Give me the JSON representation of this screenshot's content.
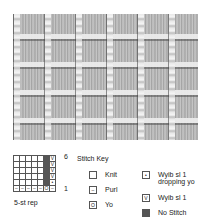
{
  "photo": {
    "alt": "Knitted swatch showing slip-stitch grid pattern"
  },
  "chart": {
    "rows": [
      [
        "",
        "",
        "",
        "",
        "",
        "dark",
        "V"
      ],
      [
        "",
        "",
        "",
        "",
        "",
        "dark",
        "V"
      ],
      [
        "",
        "",
        "",
        "",
        "",
        "dark",
        "V"
      ],
      [
        "",
        "",
        "",
        "",
        "",
        "dark",
        "V"
      ],
      [
        "",
        "",
        "",
        "",
        "",
        "dark",
        "•"
      ],
      [
        "–",
        "–",
        "–",
        "–",
        "–",
        "O",
        "–"
      ]
    ],
    "row_label_top": "6",
    "row_label_bottom": "1",
    "repeat_label": "5-st rep"
  },
  "key": {
    "title": "Stitch Key",
    "items": [
      {
        "symbol": "",
        "label": "Knit"
      },
      {
        "symbol": "–",
        "label": "Purl"
      },
      {
        "symbol": "O",
        "label": "Yo"
      },
      {
        "symbol": "•",
        "label": "Wyib sl 1 dropping yo"
      },
      {
        "symbol": "V",
        "label": "Wyib sl 1"
      },
      {
        "symbol": "dark",
        "label": "No Stitch"
      }
    ]
  }
}
